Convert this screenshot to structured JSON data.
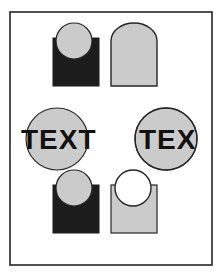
{
  "document": {
    "title": "Boolean Shape Operations Sheet",
    "background_color": "#ffffff",
    "width": 222,
    "height": 277
  },
  "frame": {
    "name": "page-border",
    "x": 10,
    "y": 12,
    "width": 202,
    "height": 253,
    "stroke_color": "#262626",
    "stroke_width": 1.6,
    "fill_color": "#ffffff"
  },
  "palette": {
    "dark_fill": "#1c1c1c",
    "light_fill": "#cbcbcb",
    "outline": "#262626",
    "white": "#ffffff",
    "text_color": "#111111"
  },
  "figures": [
    {
      "id": "fig-overlap-dark",
      "label": "Square with circle overlapping on top",
      "operation": "overlap",
      "position": "top-left",
      "square": {
        "x": 53,
        "y": 38,
        "width": 46,
        "height": 48,
        "fill": "#1c1c1c"
      },
      "circle": {
        "cx": 74,
        "cy": 41,
        "r": 18,
        "fill": "#cbcbcb"
      }
    },
    {
      "id": "fig-union-light",
      "label": "Square unioned with circle",
      "operation": "union",
      "position": "top-right",
      "square": {
        "x": 111,
        "y": 38,
        "width": 46,
        "height": 48,
        "fill": "#cbcbcb"
      },
      "circle": {
        "cx": 133,
        "cy": 41,
        "r": 18,
        "fill": "#cbcbcb"
      }
    },
    {
      "id": "fig-text-over-circle",
      "label": "TEXT word placed over circle",
      "operation": "overlap",
      "position": "middle-left",
      "circle": {
        "cx": 57,
        "cy": 139,
        "r": 31,
        "fill": "#cbcbcb"
      },
      "text": {
        "value": "TEXT",
        "x": 21,
        "y": 148,
        "size": 28,
        "fill": "#111111"
      }
    },
    {
      "id": "fig-text-clipped-circle",
      "label": "TEXT word clipped by circle",
      "operation": "intersect",
      "position": "middle-right",
      "circle": {
        "cx": 166,
        "cy": 139,
        "r": 31,
        "fill": "#cbcbcb"
      },
      "text": {
        "value": "TEXT",
        "x": 139,
        "y": 148,
        "size": 28,
        "fill": "#111111"
      }
    },
    {
      "id": "fig-overlap-dark-2",
      "label": "Square with circle overlapping on top",
      "operation": "overlap",
      "position": "bottom-left",
      "square": {
        "x": 53,
        "y": 185,
        "width": 46,
        "height": 48,
        "fill": "#1c1c1c"
      },
      "circle": {
        "cx": 74,
        "cy": 188,
        "r": 18,
        "fill": "#cbcbcb"
      }
    },
    {
      "id": "fig-difference-light",
      "label": "Square with circle subtracted leaving outline",
      "operation": "difference",
      "position": "bottom-right",
      "square": {
        "x": 111,
        "y": 185,
        "width": 46,
        "height": 48,
        "fill": "#cbcbcb"
      },
      "circle": {
        "cx": 133,
        "cy": 188,
        "r": 18,
        "fill": "#ffffff"
      }
    }
  ],
  "labels": {
    "text_word": "TEXT"
  }
}
